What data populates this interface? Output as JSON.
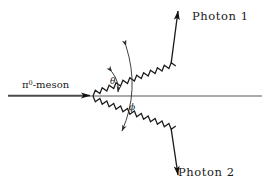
{
  "diagram": {
    "background_color": "#ffffff",
    "line_color": "#1a1a1a",
    "axis_color": "#8a8a8a",
    "labels": {
      "incoming_particle": "π",
      "incoming_particle_superscript": "0",
      "incoming_particle_suffix": "-meson",
      "photon_1": "Photon  1",
      "photon_2": "Photon  2",
      "angle_theta": "θ",
      "angle_phi": "ϕ"
    },
    "geometry": {
      "vertex_x": 93,
      "vertex_y": 96,
      "axis_y": 96,
      "axis_x_start": 8,
      "axis_x_end": 262,
      "photon1_end_x": 178,
      "photon1_end_y": 11,
      "photon2_end_x": 178,
      "photon2_end_y": 175,
      "incoming_arrow_x": 93,
      "incoming_arrow_y": 96
    }
  }
}
